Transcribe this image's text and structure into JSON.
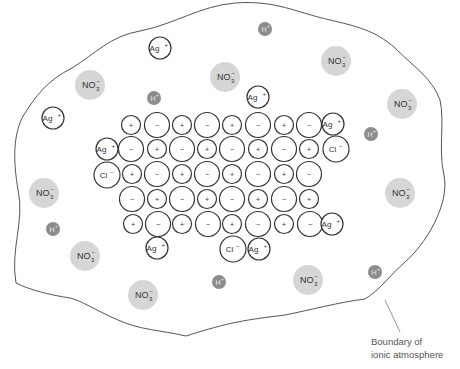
{
  "diagram": {
    "colors": {
      "outline": "#333333",
      "boundary": "#555555",
      "nitrate_fill": "#d6d6d6",
      "hydrogen_fill": "#8c8c8c",
      "hydrogen_text": "#e8e8e8"
    },
    "caption": {
      "line1": "Boundary of",
      "line2": "ionic atmosphere"
    },
    "symbols": {
      "plus": "+",
      "minus": "−"
    },
    "lattice": {
      "rows": [
        {
          "y": 125,
          "cells": [
            {
              "x": 131,
              "s": "+"
            },
            {
              "x": 157,
              "s": "-"
            },
            {
              "x": 182,
              "s": "+"
            },
            {
              "x": 207,
              "s": "-"
            },
            {
              "x": 232,
              "s": "+"
            },
            {
              "x": 258,
              "s": "-"
            },
            {
              "x": 284,
              "s": "+"
            },
            {
              "x": 309,
              "s": "-"
            }
          ]
        },
        {
          "y": 149,
          "cells": [
            {
              "x": 131,
              "s": "-"
            },
            {
              "x": 157,
              "s": "+"
            },
            {
              "x": 182,
              "s": "-"
            },
            {
              "x": 207,
              "s": "+"
            },
            {
              "x": 232,
              "s": "-"
            },
            {
              "x": 258,
              "s": "+"
            },
            {
              "x": 284,
              "s": "-"
            },
            {
              "x": 309,
              "s": "+"
            }
          ]
        },
        {
          "y": 174,
          "cells": [
            {
              "x": 132,
              "s": "+"
            },
            {
              "x": 157,
              "s": "-"
            },
            {
              "x": 182,
              "s": "+"
            },
            {
              "x": 207,
              "s": "-"
            },
            {
              "x": 232,
              "s": "+"
            },
            {
              "x": 258,
              "s": "-"
            },
            {
              "x": 284,
              "s": "+"
            },
            {
              "x": 309,
              "s": "-"
            }
          ]
        },
        {
          "y": 199,
          "cells": [
            {
              "x": 132,
              "s": "-"
            },
            {
              "x": 157,
              "s": "+"
            },
            {
              "x": 182,
              "s": "-"
            },
            {
              "x": 207,
              "s": "+"
            },
            {
              "x": 232,
              "s": "-"
            },
            {
              "x": 258,
              "s": "+"
            },
            {
              "x": 284,
              "s": "-"
            },
            {
              "x": 309,
              "s": "+"
            }
          ]
        },
        {
          "y": 224,
          "cells": [
            {
              "x": 133,
              "s": "+"
            },
            {
              "x": 158,
              "s": "-"
            },
            {
              "x": 182,
              "s": "+"
            },
            {
              "x": 208,
              "s": "-"
            },
            {
              "x": 232,
              "s": "+"
            },
            {
              "x": 258,
              "s": "-"
            },
            {
              "x": 284,
              "s": "+"
            },
            {
              "x": 310,
              "s": "-"
            }
          ]
        }
      ]
    },
    "adsorbed_ions": [
      {
        "label": "Ag",
        "sup": "+",
        "x": 258,
        "y": 97,
        "r": 11
      },
      {
        "label": "Ag",
        "sup": "+",
        "x": 333,
        "y": 124,
        "r": 11
      },
      {
        "label": "Cl",
        "sup": "−",
        "x": 336,
        "y": 149,
        "r": 13
      },
      {
        "label": "Ag",
        "sup": "+",
        "x": 107,
        "y": 149,
        "r": 11
      },
      {
        "label": "Cl",
        "sup": "−",
        "x": 107,
        "y": 175,
        "r": 13
      },
      {
        "label": "Ag",
        "sup": "+",
        "x": 332,
        "y": 224,
        "r": 11
      },
      {
        "label": "Ag",
        "sup": "+",
        "x": 157,
        "y": 248,
        "r": 11
      },
      {
        "label": "Cl",
        "sup": "−",
        "x": 233,
        "y": 249,
        "r": 13
      },
      {
        "label": "Ag",
        "sup": "+",
        "x": 259,
        "y": 249,
        "r": 11
      }
    ],
    "solution_ag_ions": [
      {
        "label": "Ag",
        "sup": "+",
        "x": 160,
        "y": 48,
        "r": 11
      },
      {
        "label": "Ag",
        "sup": "+",
        "x": 53,
        "y": 118,
        "r": 11
      }
    ],
    "nitrate_ions": [
      {
        "x": 90,
        "y": 85
      },
      {
        "x": 225,
        "y": 77
      },
      {
        "x": 336,
        "y": 61
      },
      {
        "x": 402,
        "y": 104
      },
      {
        "x": 44,
        "y": 193
      },
      {
        "x": 400,
        "y": 193
      },
      {
        "x": 85,
        "y": 256
      },
      {
        "x": 143,
        "y": 295
      },
      {
        "x": 308,
        "y": 280
      },
      {
        "x": 231,
        "y": 77
      }
    ],
    "nitrate_label": {
      "main": "NO",
      "sub": "3",
      "sup": "−"
    },
    "hydrogen_ions": [
      {
        "x": 265,
        "y": 29
      },
      {
        "x": 154,
        "y": 98
      },
      {
        "x": 371,
        "y": 134
      },
      {
        "x": 53,
        "y": 229
      },
      {
        "x": 219,
        "y": 282
      },
      {
        "x": 375,
        "y": 272
      }
    ],
    "hydrogen_label": {
      "main": "H",
      "sup": "+"
    }
  }
}
